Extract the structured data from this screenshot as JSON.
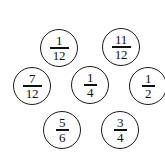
{
  "figure": {
    "background_color": "#ffffff",
    "stroke_color": "#1a1a1a",
    "text_color": "#111111"
  },
  "circles": [
    {
      "id": "circle-1-12",
      "numerator": "1",
      "denominator": "12",
      "value": "1/12",
      "row": "top",
      "x": 40,
      "y": 29,
      "diameter": 38
    },
    {
      "id": "circle-11-12",
      "numerator": "11",
      "denominator": "12",
      "value": "11/12",
      "row": "top",
      "x": 102,
      "y": 28,
      "diameter": 38
    },
    {
      "id": "circle-7-12",
      "numerator": "7",
      "denominator": "12",
      "value": "7/12",
      "row": "middle",
      "x": 13,
      "y": 67,
      "diameter": 38
    },
    {
      "id": "circle-1-4",
      "numerator": "1",
      "denominator": "4",
      "value": "1/4",
      "row": "middle",
      "x": 71,
      "y": 66,
      "diameter": 38
    },
    {
      "id": "circle-1-2",
      "numerator": "1",
      "denominator": "2",
      "value": "1/2",
      "row": "middle",
      "x": 129,
      "y": 67,
      "diameter": 38
    },
    {
      "id": "circle-5-6",
      "numerator": "5",
      "denominator": "6",
      "value": "5/6",
      "row": "bottom",
      "x": 43,
      "y": 111,
      "diameter": 38
    },
    {
      "id": "circle-3-4",
      "numerator": "3",
      "denominator": "4",
      "value": "3/4",
      "row": "bottom",
      "x": 101,
      "y": 111,
      "diameter": 38
    }
  ]
}
